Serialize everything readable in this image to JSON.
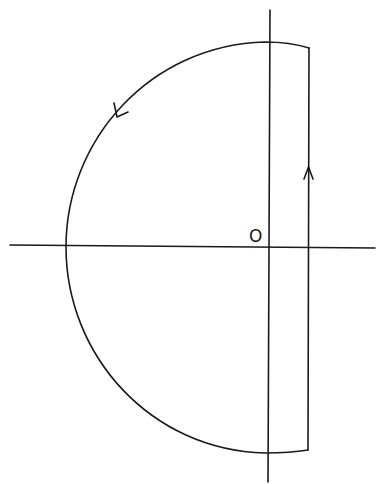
{
  "diagram": {
    "type": "contour-diagram",
    "origin_label": "O",
    "stroke_color": "#1a1a1a",
    "background": "#ffffff",
    "elements": [
      {
        "name": "real-axis",
        "kind": "line"
      },
      {
        "name": "imaginary-axis",
        "kind": "line"
      },
      {
        "name": "vertical-contour-segment",
        "kind": "line",
        "direction": "up"
      },
      {
        "name": "semicircular-arc",
        "kind": "arc",
        "direction": "counterclockwise"
      }
    ]
  }
}
